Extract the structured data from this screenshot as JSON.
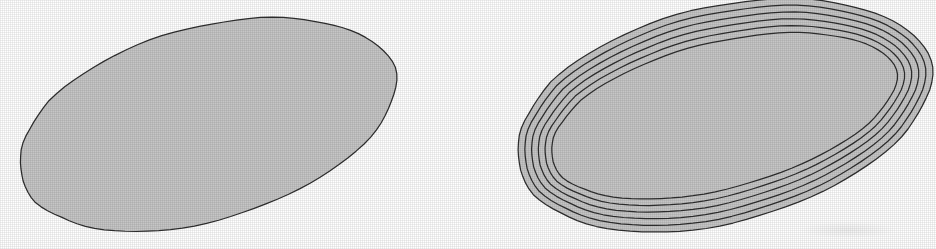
{
  "figure": {
    "background_color": "#ffffff",
    "fill_color": "#c6c6c6",
    "stroke_color": "#2e2e2e",
    "stroke_width": 1.25,
    "caption": ""
  },
  "chart_data": {
    "type": "diagram",
    "title": "",
    "subtitle": "",
    "xlabel": "",
    "ylabel": "",
    "grid": false,
    "legend": "none",
    "panels": [
      {
        "name": "panel-left",
        "label": "",
        "contour_count": 1,
        "offsets": [
          0
        ],
        "bbox": {
          "x": 10,
          "y": 25,
          "width": 387,
          "height": 202
        },
        "center": {
          "x": 203,
          "y": 126
        },
        "rotation_deg": -17,
        "radii": {
          "a": 196,
          "b": 97
        },
        "boundary_points": [
          [
            0.0,
            196,
            0
          ],
          [
            15.0,
            195,
            0
          ],
          [
            30.0,
            193,
            1
          ],
          [
            45.0,
            194,
            -1
          ],
          [
            60.0,
            192,
            1
          ],
          [
            75.0,
            193,
            0
          ],
          [
            90.0,
            194,
            -1
          ],
          [
            105.0,
            192,
            1
          ],
          [
            120.0,
            195,
            0
          ],
          [
            135.0,
            193,
            1
          ],
          [
            150.0,
            194,
            -1
          ],
          [
            165.0,
            196,
            0
          ],
          [
            180.0,
            195,
            1
          ],
          [
            195.0,
            193,
            0
          ],
          [
            210.0,
            194,
            -1
          ],
          [
            225.0,
            195,
            1
          ],
          [
            240.0,
            193,
            0
          ],
          [
            255.0,
            192,
            1
          ],
          [
            270.0,
            194,
            0
          ],
          [
            285.0,
            195,
            -1
          ],
          [
            300.0,
            193,
            1
          ],
          [
            315.0,
            194,
            0
          ],
          [
            330.0,
            196,
            -1
          ],
          [
            345.0,
            195,
            1
          ]
        ]
      },
      {
        "name": "panel-right",
        "label": "",
        "contour_count": 6,
        "offsets": [
          0,
          7,
          14,
          21,
          28,
          35
        ],
        "bbox": {
          "x": 508,
          "y": 7,
          "width": 422,
          "height": 221
        },
        "center": {
          "x": 719,
          "y": 117
        },
        "rotation_deg": -15,
        "radii": {
          "a": 214,
          "b": 108
        },
        "boundary_points": [
          [
            0.0,
            214,
            0
          ],
          [
            15.0,
            213,
            1
          ],
          [
            30.0,
            211,
            0
          ],
          [
            45.0,
            212,
            -1
          ],
          [
            60.0,
            210,
            1
          ],
          [
            75.0,
            212,
            0
          ],
          [
            90.0,
            213,
            -1
          ],
          [
            105.0,
            211,
            1
          ],
          [
            120.0,
            214,
            0
          ],
          [
            135.0,
            212,
            1
          ],
          [
            150.0,
            213,
            -1
          ],
          [
            165.0,
            214,
            0
          ],
          [
            180.0,
            213,
            1
          ],
          [
            195.0,
            211,
            0
          ],
          [
            210.0,
            212,
            -1
          ],
          [
            225.0,
            214,
            1
          ],
          [
            240.0,
            212,
            0
          ],
          [
            255.0,
            210,
            1
          ],
          [
            270.0,
            213,
            0
          ],
          [
            285.0,
            214,
            -1
          ],
          [
            300.0,
            212,
            1
          ],
          [
            315.0,
            213,
            0
          ],
          [
            330.0,
            215,
            -1
          ],
          [
            345.0,
            214,
            1
          ]
        ]
      }
    ]
  },
  "annotations": {
    "smudge_label": "scan-smudge"
  }
}
